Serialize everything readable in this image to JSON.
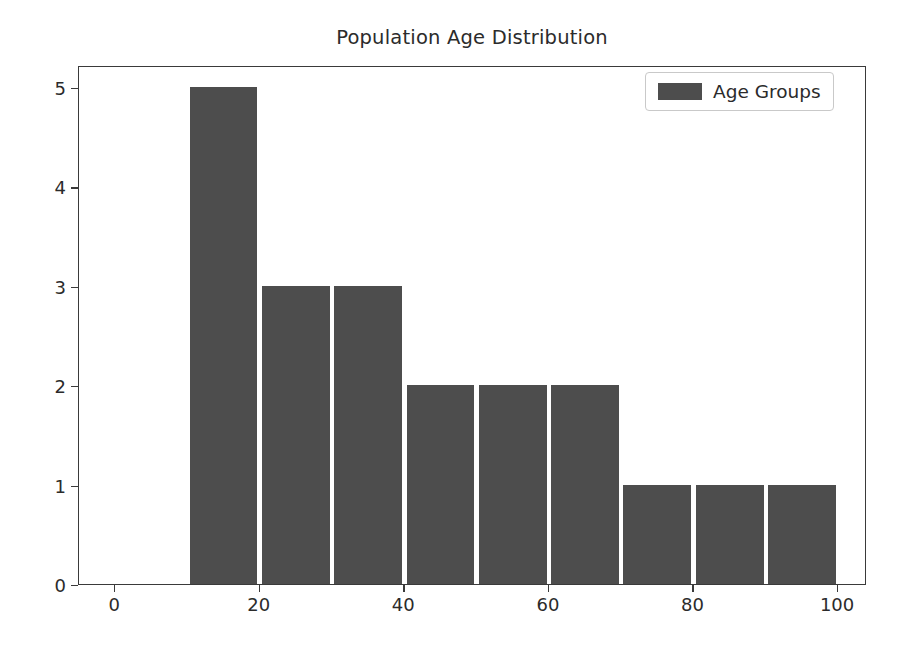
{
  "chart_data": {
    "type": "bar",
    "title": "Population Age Distribution",
    "xlabel": "",
    "ylabel": "",
    "xlim": [
      -5,
      104
    ],
    "ylim": [
      0,
      5.22
    ],
    "grid": false,
    "legend_position": "upper right",
    "xticks": [
      0,
      20,
      40,
      60,
      80,
      100
    ],
    "xtick_labels": [
      "0",
      "20",
      "40",
      "60",
      "80",
      "100"
    ],
    "yticks": [
      0,
      1,
      2,
      3,
      4,
      5
    ],
    "ytick_labels": [
      "0",
      "1",
      "2",
      "3",
      "4",
      "5"
    ],
    "bar_color": "#4d4d4d",
    "series": [
      {
        "name": "Age Groups",
        "bin_edges": [
          10,
          20,
          30,
          40,
          50,
          60,
          70,
          80,
          90,
          100
        ],
        "categories": [
          "10-20",
          "20-30",
          "30-40",
          "40-50",
          "50-60",
          "60-70",
          "70-80",
          "80-90",
          "90-100"
        ],
        "values": [
          5,
          3,
          3,
          2,
          2,
          2,
          1,
          1,
          1
        ]
      }
    ]
  },
  "legend": {
    "entries": [
      {
        "label": "Age Groups",
        "color": "#4d4d4d"
      }
    ]
  }
}
